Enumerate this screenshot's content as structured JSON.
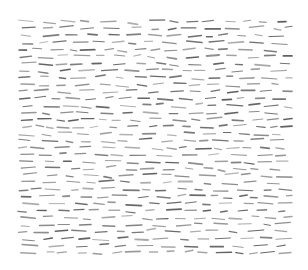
{
  "image": {
    "description": "Abstract texture of many short gray horizontal dashes on a white background",
    "background": "#ffffff",
    "dash_color": "#555555",
    "field": {
      "x": 18,
      "y": 18,
      "width": 274,
      "height": 238
    },
    "rows": 34,
    "dash_length_range": [
      6,
      16
    ],
    "slant_range": [
      -1.5,
      1.5
    ]
  }
}
